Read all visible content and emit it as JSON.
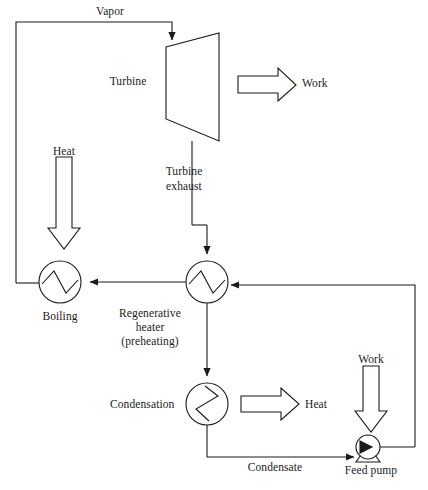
{
  "diagram": {
    "stroke_color": "#1a1a1a",
    "fill_color": "#ffffff",
    "background": "#ffffff"
  },
  "labels": {
    "vapor": "Vapor",
    "turbine": "Turbine",
    "work_turbine": "Work",
    "heat_boiler": "Heat",
    "turbine_exhaust_line1": "Turbine",
    "turbine_exhaust_line2": "exhaust",
    "boiling": "Boiling",
    "regenerative_heater_line1": "Regenerative",
    "regenerative_heater_line2": "heater",
    "regenerative_heater_line3": "(preheating)",
    "condensation": "Condensation",
    "heat_condenser": "Heat",
    "work_pump": "Work",
    "condensate": "Condensate",
    "feed_pump": "Feed pump"
  },
  "components": [
    {
      "id": "turbine",
      "name": "turbine",
      "shape": "trapezoid",
      "label": "Turbine"
    },
    {
      "id": "boiler",
      "name": "boiling-heat-exchanger",
      "shape": "circle-zigzag-horizontal",
      "label": "Boiling",
      "cx": 60,
      "cy": 282,
      "r": 21
    },
    {
      "id": "regenerative-heater",
      "name": "regenerative-heater",
      "shape": "circle-zigzag-horizontal",
      "label": "Regenerative heater (preheating)",
      "cx": 207,
      "cy": 282,
      "r": 21
    },
    {
      "id": "condenser",
      "name": "condensation-heat-exchanger",
      "shape": "circle-zigzag-vertical",
      "label": "Condensation",
      "cx": 207,
      "cy": 404,
      "r": 21
    },
    {
      "id": "feed-pump",
      "name": "feed-pump",
      "shape": "circle-triangle-pedestal",
      "label": "Feed pump",
      "cx": 368,
      "cy": 447,
      "r": 12
    }
  ],
  "streams": [
    {
      "id": "vapor",
      "label": "Vapor",
      "from": "boiler",
      "to": "turbine"
    },
    {
      "id": "turbine-exhaust",
      "label": "Turbine exhaust",
      "from": "turbine",
      "to": "regenerative-heater"
    },
    {
      "id": "heater-to-boiler",
      "label": "",
      "from": "regenerative-heater",
      "to": "boiler"
    },
    {
      "id": "heater-to-condenser",
      "label": "",
      "from": "regenerative-heater",
      "to": "condenser"
    },
    {
      "id": "condensate",
      "label": "Condensate",
      "from": "condenser",
      "to": "feed-pump"
    },
    {
      "id": "pump-to-heater",
      "label": "",
      "from": "feed-pump",
      "to": "regenerative-heater"
    }
  ],
  "energy_arrows": [
    {
      "id": "heat-in-boiler",
      "label": "Heat",
      "direction": "down",
      "kind": "heat-input"
    },
    {
      "id": "work-out-turbine",
      "label": "Work",
      "direction": "right",
      "kind": "work-output"
    },
    {
      "id": "heat-out-condenser",
      "label": "Heat",
      "direction": "right",
      "kind": "heat-rejected"
    },
    {
      "id": "work-in-pump",
      "label": "Work",
      "direction": "down",
      "kind": "work-input"
    }
  ]
}
